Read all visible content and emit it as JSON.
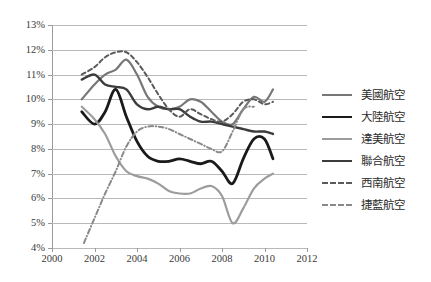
{
  "chart_data": {
    "type": "line",
    "title": "",
    "subtitle": "",
    "xlabel": "",
    "ylabel": "",
    "xlim": [
      2000,
      2012
    ],
    "ylim": [
      0.04,
      0.13
    ],
    "xticks": [
      "2000",
      "2002",
      "2004",
      "2006",
      "2008",
      "2010",
      "2012"
    ],
    "xtick_values": [
      2000,
      2002,
      2004,
      2006,
      2008,
      2010,
      2012
    ],
    "yticks": [
      "4%",
      "5%",
      "6%",
      "7%",
      "8%",
      "9%",
      "10%",
      "11%",
      "12%",
      "13%"
    ],
    "ytick_values": [
      0.04,
      0.05,
      0.06,
      0.07,
      0.08,
      0.09,
      0.1,
      0.11,
      0.12,
      0.13
    ],
    "grid": "horizontal",
    "legend_position": "right",
    "series": [
      {
        "name": "美國航空",
        "color": "#777777",
        "dash": "solid",
        "width": 2.2,
        "x": [
          2001.4,
          2002.0,
          2002.5,
          2003.0,
          2003.5,
          2004.0,
          2004.5,
          2005.0,
          2005.5,
          2006.0,
          2006.5,
          2007.0,
          2007.5,
          2008.0,
          2008.5,
          2009.0,
          2009.5,
          2010.0,
          2010.4
        ],
        "values": [
          10.0,
          10.6,
          11.0,
          11.2,
          11.6,
          11.0,
          10.1,
          9.7,
          9.6,
          9.7,
          10.0,
          9.9,
          9.5,
          9.1,
          9.0,
          9.6,
          10.1,
          9.9,
          10.4
        ]
      },
      {
        "name": "大陸航空",
        "color": "#1a1a1a",
        "dash": "solid",
        "width": 2.8,
        "x": [
          2001.4,
          2002.0,
          2002.5,
          2003.0,
          2003.5,
          2004.0,
          2004.5,
          2005.0,
          2005.5,
          2006.0,
          2006.5,
          2007.0,
          2007.5,
          2008.0,
          2008.5,
          2009.0,
          2009.5,
          2010.0,
          2010.4
        ],
        "values": [
          9.5,
          9.0,
          9.5,
          10.4,
          9.3,
          8.3,
          7.7,
          7.5,
          7.5,
          7.6,
          7.5,
          7.4,
          7.5,
          7.1,
          6.6,
          7.6,
          8.4,
          8.4,
          7.6
        ]
      },
      {
        "name": "達美航空",
        "color": "#9c9c9c",
        "dash": "solid",
        "width": 2.2,
        "x": [
          2001.4,
          2002.0,
          2002.5,
          2003.0,
          2003.5,
          2004.0,
          2004.5,
          2005.0,
          2005.5,
          2006.0,
          2006.5,
          2007.0,
          2007.5,
          2008.0,
          2008.5,
          2009.0,
          2009.5,
          2010.0,
          2010.4
        ],
        "values": [
          9.7,
          9.2,
          8.6,
          7.7,
          7.1,
          6.9,
          6.8,
          6.6,
          6.3,
          6.2,
          6.2,
          6.4,
          6.5,
          6.1,
          5.0,
          5.6,
          6.4,
          6.8,
          7.0
        ]
      },
      {
        "name": "聯合航空",
        "color": "#3c3c3c",
        "dash": "solid",
        "width": 2.4,
        "x": [
          2001.4,
          2002.0,
          2002.5,
          2003.0,
          2003.5,
          2004.0,
          2004.5,
          2005.0,
          2005.5,
          2006.0,
          2006.5,
          2007.0,
          2007.5,
          2008.0,
          2008.5,
          2009.0,
          2009.5,
          2010.0,
          2010.4
        ],
        "values": [
          10.8,
          11.0,
          10.6,
          10.5,
          10.4,
          9.8,
          9.6,
          9.7,
          9.6,
          9.6,
          9.3,
          9.1,
          9.1,
          9.0,
          8.9,
          8.8,
          8.7,
          8.7,
          8.6
        ]
      },
      {
        "name": "西南航空",
        "color": "#5a5a5a",
        "dash": "dashed",
        "width": 2.0,
        "x": [
          2001.4,
          2002.0,
          2002.5,
          2003.0,
          2003.5,
          2004.0,
          2004.5,
          2005.0,
          2005.5,
          2006.0,
          2006.5,
          2007.0,
          2007.5,
          2008.0,
          2008.5,
          2009.0,
          2009.5,
          2010.0,
          2010.4
        ],
        "values": [
          11.0,
          11.3,
          11.7,
          11.9,
          11.9,
          11.5,
          10.9,
          10.2,
          9.6,
          9.3,
          9.6,
          9.4,
          9.2,
          9.1,
          9.4,
          9.9,
          10.0,
          9.8,
          9.9
        ]
      },
      {
        "name": "捷藍航空",
        "color": "#8a8a8a",
        "dash": "dashdot",
        "width": 2.0,
        "x": [
          2001.5,
          2002.0,
          2002.5,
          2003.0,
          2003.5,
          2004.0,
          2004.5,
          2005.0,
          2005.5,
          2006.0,
          2006.5,
          2007.0,
          2007.5,
          2008.0,
          2008.5,
          2009.0,
          2009.5
        ],
        "values": [
          4.2,
          5.2,
          6.2,
          7.1,
          8.1,
          8.7,
          8.9,
          8.9,
          8.8,
          8.6,
          8.4,
          8.2,
          8.0,
          7.9,
          8.7,
          9.6,
          9.7
        ]
      }
    ]
  },
  "legend": {
    "items": [
      {
        "label": "美國航空"
      },
      {
        "label": "大陸航空"
      },
      {
        "label": "達美航空"
      },
      {
        "label": "聯合航空"
      },
      {
        "label": "西南航空"
      },
      {
        "label": "捷藍航空"
      }
    ]
  }
}
